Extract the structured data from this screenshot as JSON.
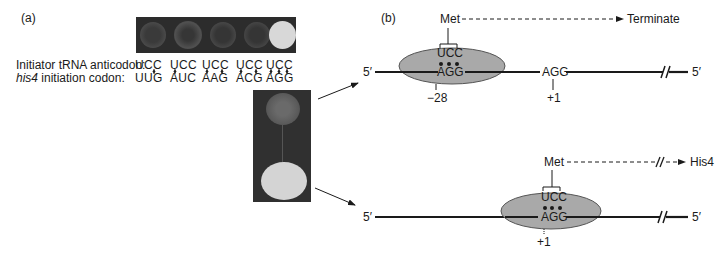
{
  "panel_a": {
    "label": "(a)",
    "row_labels": {
      "anticodon": "Initiator tRNA anticodon:",
      "codon_italic": "his4",
      "codon_rest": " initiation codon:"
    },
    "columns": [
      {
        "anticodon": "UCC",
        "codon": "UUG",
        "growth": "none"
      },
      {
        "anticodon": "UCC",
        "codon": "AUC",
        "growth": "none"
      },
      {
        "anticodon": "UCC",
        "codon": "AAG",
        "growth": "none"
      },
      {
        "anticodon": "UCC",
        "codon": "ACG",
        "growth": "none"
      },
      {
        "anticodon": "UCC",
        "codon": "AGG",
        "growth": "strong"
      }
    ],
    "vertical_plate": {
      "colonies": [
        {
          "position": "top",
          "growth": "weak"
        },
        {
          "position": "bottom",
          "growth": "strong"
        }
      ]
    }
  },
  "panel_b": {
    "label": "(b)",
    "top_scenario": {
      "five_prime_left": "5′",
      "five_prime_right": "5′",
      "met_label": "Met",
      "outcome": "Terminate",
      "anticodon": "UCC",
      "codon": "AGG",
      "ribosome_position": "−28",
      "downstream_codon": "AGG",
      "downstream_position": "+1"
    },
    "bottom_scenario": {
      "five_prime_left": "5′",
      "five_prime_right": "5′",
      "met_label": "Met",
      "outcome": "His4",
      "anticodon": "UCC",
      "codon": "AGG",
      "ribosome_position": "+1"
    }
  },
  "colors": {
    "ink": "#1a1a1a",
    "ribosome_fill": "#a9a9a9",
    "ribosome_stroke": "#555555",
    "plate_background": "#2c2c2c",
    "colony_strong": "#d6d6d6",
    "colony_weak": "#5a5a5a"
  }
}
